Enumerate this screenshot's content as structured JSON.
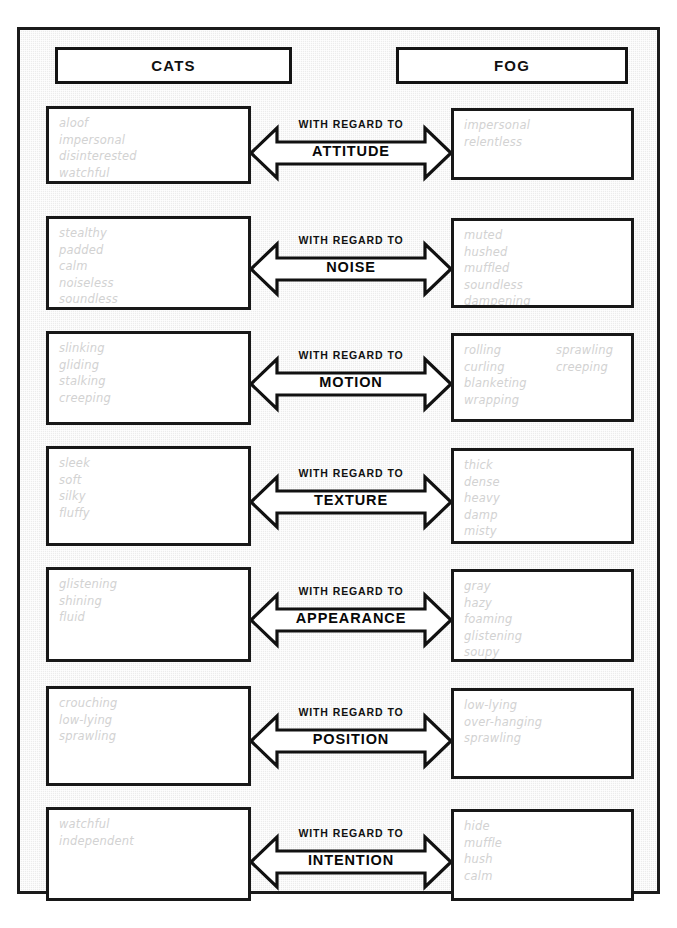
{
  "header": {
    "left_label": "CATS",
    "right_label": "FOG"
  },
  "connector_prefix": "WITH  REGARD  TO",
  "rows": [
    {
      "category": "ATTITUDE",
      "left_words": [
        "aloof",
        "impersonal",
        "disinterested",
        "watchful"
      ],
      "left_words_col2": [],
      "right_words": [
        "impersonal",
        "relentless"
      ],
      "right_words_col2": []
    },
    {
      "category": "NOISE",
      "left_words": [
        "stealthy",
        "padded",
        "calm",
        "noiseless",
        "soundless"
      ],
      "left_words_col2": [],
      "right_words": [
        "muted",
        "hushed",
        "muffled",
        "soundless",
        "dampening"
      ],
      "right_words_col2": []
    },
    {
      "category": "MOTION",
      "left_words": [
        "slinking",
        "gliding",
        "stalking",
        "creeping"
      ],
      "left_words_col2": [],
      "right_words": [
        "rolling",
        "curling",
        "blanketing",
        "wrapping"
      ],
      "right_words_col2": [
        "sprawling",
        "creeping"
      ]
    },
    {
      "category": "TEXTURE",
      "left_words": [
        "sleek",
        "soft",
        "silky",
        "fluffy"
      ],
      "left_words_col2": [],
      "right_words": [
        "thick",
        "dense",
        "heavy",
        "damp",
        "misty"
      ],
      "right_words_col2": []
    },
    {
      "category": "APPEARANCE",
      "left_words": [
        "glistening",
        "shining",
        "fluid"
      ],
      "left_words_col2": [],
      "right_words": [
        "gray",
        "hazy",
        "foaming",
        "glistening",
        "soupy"
      ],
      "right_words_col2": []
    },
    {
      "category": "POSITION",
      "left_words": [
        "crouching",
        "low-lying",
        "sprawling"
      ],
      "left_words_col2": [],
      "right_words": [
        "low-lying",
        "over-hanging",
        "sprawling"
      ],
      "right_words_col2": []
    },
    {
      "category": "INTENTION",
      "left_words": [
        "watchful",
        "independent"
      ],
      "left_words_col2": [],
      "right_words": [
        "hide",
        "muffle",
        "hush",
        "calm"
      ],
      "right_words_col2": []
    }
  ],
  "colors": {
    "frame_border": "#1b1b1b",
    "frame_background": "#ececec",
    "box_border": "#181818",
    "box_background": "#ffffff",
    "word_text": "#d2d2d2",
    "label_text": "#111111"
  },
  "layout": {
    "row_geometry": [
      {
        "top": 76,
        "box_height": 78,
        "right_top": 78,
        "right_height": 72,
        "arrow_top": 91
      },
      {
        "top": 186,
        "box_height": 94,
        "right_top": 188,
        "right_height": 90,
        "arrow_top": 207
      },
      {
        "top": 301,
        "box_height": 94,
        "right_top": 303,
        "right_height": 89,
        "arrow_top": 322
      },
      {
        "top": 416,
        "box_height": 100,
        "right_top": 418,
        "right_height": 96,
        "arrow_top": 440
      },
      {
        "top": 537,
        "box_height": 95,
        "right_top": 539,
        "right_height": 93,
        "arrow_top": 558
      },
      {
        "top": 656,
        "box_height": 100,
        "right_top": 658,
        "right_height": 91,
        "arrow_top": 679
      },
      {
        "top": 777,
        "box_height": 94,
        "right_top": 779,
        "right_height": 92,
        "arrow_top": 800
      }
    ]
  }
}
